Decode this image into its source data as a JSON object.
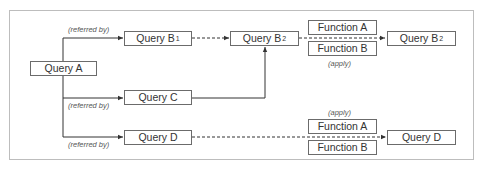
{
  "diagram": {
    "nodes": {
      "query_a": {
        "label": "Query A"
      },
      "query_b1": {
        "label": "Query B",
        "sub": "1"
      },
      "query_b2_src": {
        "label": "Query B",
        "sub": "2"
      },
      "query_b2_out": {
        "label": "Query B",
        "sub": "2"
      },
      "query_c": {
        "label": "Query C"
      },
      "query_d_src": {
        "label": "Query D"
      },
      "query_d_out": {
        "label": "Query D"
      },
      "func_a_top": {
        "label": "Function A"
      },
      "func_b_top": {
        "label": "Function B"
      },
      "func_a_bottom": {
        "label": "Function A"
      },
      "func_b_bottom": {
        "label": "Function B"
      }
    },
    "edge_labels": {
      "referred_by_b1": "(referred by)",
      "referred_by_c": "(referred by)",
      "referred_by_d": "(referred by)",
      "apply_top": "(apply)",
      "apply_bottom": "(apply)"
    },
    "edges": [
      {
        "from": "Query A",
        "to": "Query B1",
        "style": "solid",
        "label": "(referred by)"
      },
      {
        "from": "Query A",
        "to": "Query C",
        "style": "solid",
        "label": "(referred by)"
      },
      {
        "from": "Query A",
        "to": "Query D",
        "style": "solid",
        "label": "(referred by)"
      },
      {
        "from": "Query B1",
        "to": "Query B2",
        "style": "dashed"
      },
      {
        "from": "Query C",
        "to": "Query B2",
        "style": "solid"
      },
      {
        "from": "Query B2",
        "to": "Query B2 (output)",
        "style": "dashed",
        "label": "(apply)",
        "via": [
          "Function A",
          "Function B"
        ]
      },
      {
        "from": "Query D",
        "to": "Query D (output)",
        "style": "dashed",
        "label": "(apply)",
        "via": [
          "Function A",
          "Function B"
        ]
      }
    ],
    "colors": {
      "line": "#333333",
      "box_border": "#6b6b6b",
      "frame": "#bdbdbd",
      "text": "#333333"
    }
  }
}
